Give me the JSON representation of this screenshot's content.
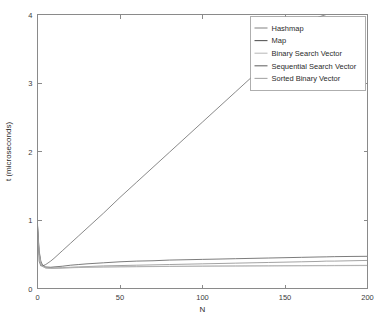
{
  "chart_data": {
    "type": "line",
    "title": "",
    "subtitle": "",
    "xlabel": "N",
    "ylabel": "t (microseconds)",
    "xlim": [
      0,
      200
    ],
    "ylim": [
      0,
      4
    ],
    "xticks": [
      0,
      50,
      100,
      150,
      200
    ],
    "yticks": [
      0,
      1,
      2,
      3,
      4
    ],
    "xticklabels": [
      "0",
      "50",
      "100",
      "150",
      "200"
    ],
    "yticklabels": [
      "0",
      "1",
      "2",
      "3",
      "4"
    ],
    "grid": false,
    "legend_position": "upper right",
    "annotations": [],
    "x": [
      0,
      1,
      2,
      3,
      5,
      8,
      10,
      15,
      20,
      25,
      30,
      40,
      50,
      60,
      70,
      80,
      90,
      100,
      110,
      120,
      130,
      140,
      150,
      160,
      170,
      175,
      180,
      190,
      200
    ],
    "series": [
      {
        "name": "Hashmap",
        "color": "#8c8c8c",
        "values": [
          0.9,
          0.52,
          0.38,
          0.33,
          0.305,
          0.3,
          0.3,
          0.305,
          0.31,
          0.315,
          0.32,
          0.33,
          0.335,
          0.34,
          0.345,
          0.35,
          0.355,
          0.36,
          0.365,
          0.37,
          0.375,
          0.38,
          0.385,
          0.39,
          0.395,
          0.4,
          0.4,
          0.405,
          0.41
        ]
      },
      {
        "name": "Map",
        "color": "#5a5a5a",
        "values": [
          0.92,
          0.55,
          0.4,
          0.345,
          0.315,
          0.31,
          0.315,
          0.325,
          0.34,
          0.35,
          0.36,
          0.375,
          0.39,
          0.4,
          0.405,
          0.415,
          0.42,
          0.425,
          0.43,
          0.435,
          0.44,
          0.445,
          0.45,
          0.455,
          0.46,
          0.462,
          0.465,
          0.468,
          0.47
        ]
      },
      {
        "name": "Binary Search Vector",
        "color": "#bdbdbd",
        "values": [
          0.88,
          0.5,
          0.37,
          0.325,
          0.3,
          0.295,
          0.295,
          0.3,
          0.305,
          0.31,
          0.312,
          0.315,
          0.318,
          0.32,
          0.322,
          0.324,
          0.326,
          0.328,
          0.33,
          0.331,
          0.332,
          0.333,
          0.334,
          0.335,
          0.336,
          0.336,
          0.337,
          0.338,
          0.339
        ]
      },
      {
        "name": "Sequential Search Vector",
        "color": "#6b6b6b",
        "values": [
          0.95,
          0.4,
          0.33,
          0.33,
          0.35,
          0.4,
          0.44,
          0.55,
          0.66,
          0.77,
          0.88,
          1.1,
          1.33,
          1.55,
          1.77,
          1.99,
          2.21,
          2.43,
          2.65,
          2.87,
          3.09,
          3.31,
          3.53,
          3.75,
          3.96,
          4.0,
          null,
          null,
          null
        ]
      },
      {
        "name": "Sorted Binary Vector",
        "color": "#a8a8a8",
        "values": [
          0.86,
          0.49,
          0.365,
          0.322,
          0.298,
          0.293,
          0.293,
          0.297,
          0.302,
          0.306,
          0.309,
          0.313,
          0.316,
          0.318,
          0.32,
          0.322,
          0.323,
          0.325,
          0.326,
          0.327,
          0.328,
          0.329,
          0.33,
          0.331,
          0.332,
          0.332,
          0.333,
          0.334,
          0.335
        ]
      }
    ]
  },
  "legend": {
    "entries": [
      {
        "label": "Hashmap"
      },
      {
        "label": "Map"
      },
      {
        "label": "Binary Search Vector"
      },
      {
        "label": "Sequential Search Vector"
      },
      {
        "label": "Sorted Binary Vector"
      }
    ]
  }
}
